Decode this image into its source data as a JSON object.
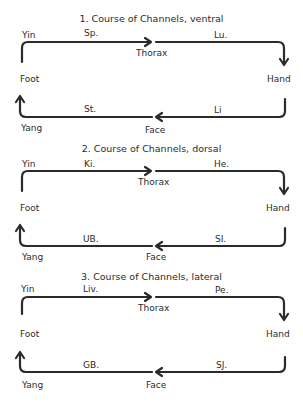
{
  "diagrams": [
    {
      "title": "1. Course of Channels, ventral",
      "yin": "Yin",
      "yang": "Yang",
      "foot": "Foot",
      "hand": "Hand",
      "thorax": "Thorax",
      "face": "Face",
      "top_left_channel": "Sp.",
      "top_right_channel": "Lu.",
      "bottom_left_channel": "St.",
      "bottom_right_channel": "Li"
    },
    {
      "title": "2. Course of Channels, dorsal",
      "yin": "Yin",
      "yang": "Yang",
      "foot": "Foot",
      "hand": "Hand",
      "thorax": "Thorax",
      "face": "Face",
      "top_left_channel": "Ki.",
      "top_right_channel": "He.",
      "bottom_left_channel": "UB.",
      "bottom_right_channel": "SI."
    },
    {
      "title": "3. Course of Channels, lateral",
      "yin": "Yin",
      "yang": "Yang",
      "foot": "Foot",
      "hand": "Hand",
      "thorax": "Thorax",
      "face": "Face",
      "top_left_channel": "Liv.",
      "top_right_channel": "Pe.",
      "bottom_left_channel": "GB.",
      "bottom_right_channel": "SJ."
    }
  ],
  "colors": {
    "line": "#2a2a2a",
    "background": "#ffffff"
  }
}
